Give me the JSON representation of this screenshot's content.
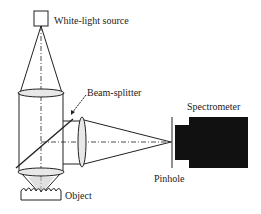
{
  "diagram": {
    "type": "optical-setup",
    "labels": {
      "source": "White-light source",
      "beam_splitter": "Beam-splitter",
      "spectrometer": "Spectrometer",
      "pinhole": "Pinhole",
      "object": "Object"
    },
    "components": [
      {
        "id": "white-light-source",
        "shape": "square"
      },
      {
        "id": "collimating-lens",
        "shape": "ellipse-horizontal"
      },
      {
        "id": "beam-splitter",
        "shape": "diagonal-line"
      },
      {
        "id": "focusing-lens",
        "shape": "ellipse-vertical"
      },
      {
        "id": "pinhole",
        "shape": "vertical-line"
      },
      {
        "id": "spectrometer",
        "shape": "black-block"
      },
      {
        "id": "objective-lens",
        "shape": "ellipse-horizontal"
      },
      {
        "id": "object",
        "shape": "rough-surface"
      }
    ],
    "colors": {
      "line": "#222222",
      "spectrometer": "#111111",
      "lens_fill": "#e8e8e8"
    }
  }
}
